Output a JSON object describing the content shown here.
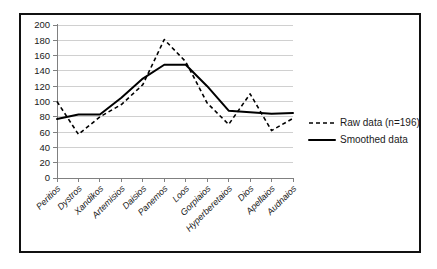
{
  "chart_data": {
    "type": "line",
    "title": "",
    "xlabel": "",
    "ylabel": "",
    "ylim": [
      0,
      200
    ],
    "ytick_step": 20,
    "grid": true,
    "legend_position": "right",
    "categories": [
      "Peritios",
      "Dystros",
      "Xandikos",
      "Artemisios",
      "Daisios",
      "Panemos",
      "Loos",
      "Gorpiaios",
      "Hyperberetaios",
      "Dios",
      "Apellaios",
      "Audnaios"
    ],
    "ytick_labels": [
      "0",
      "20",
      "40",
      "60",
      "80",
      "100",
      "120",
      "140",
      "160",
      "180",
      "200"
    ],
    "series": [
      {
        "name": "Raw data (n=196)",
        "style": "dashed",
        "color": "#000000",
        "values": [
          100,
          57,
          80,
          96,
          122,
          181,
          152,
          98,
          70,
          110,
          62,
          78
        ]
      },
      {
        "name": "Smoothed data",
        "style": "solid",
        "color": "#000000",
        "values": [
          77,
          83,
          83,
          105,
          130,
          148,
          148,
          120,
          88,
          86,
          84,
          85
        ]
      }
    ]
  },
  "legend": {
    "items": [
      {
        "label": "Raw data (n=196)",
        "style": "dashed"
      },
      {
        "label": "Smoothed data",
        "style": "solid"
      }
    ]
  }
}
